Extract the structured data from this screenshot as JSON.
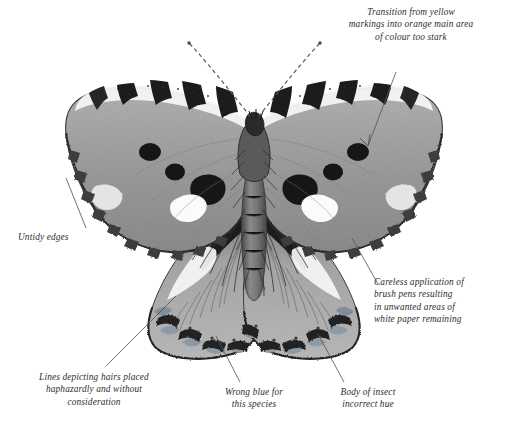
{
  "figure": {
    "species_implied": "small tortoiseshell",
    "medium": "pen and ink with grey wash",
    "palette": {
      "paper": "#ffffff",
      "ink": "#2e2c2b",
      "wing_grey": "#9a9a9a",
      "wing_light": "#c8c8c8",
      "wing_dark": "#3a3a3a",
      "black": "#1a1a1a",
      "leader_line": "#55585c"
    }
  },
  "annotations": [
    {
      "id": "transition",
      "text": "Transition from yellow\nmarkings into orange main area\nof colour too stark",
      "position": "top-right",
      "leader": "arrow"
    },
    {
      "id": "untidy",
      "text": "Untidy edges",
      "position": "left",
      "leader": "line"
    },
    {
      "id": "careless",
      "text": "Careless application of\nbrush pens resulting\nin unwanted areas of\nwhite paper remaining",
      "position": "right",
      "leader": "line"
    },
    {
      "id": "lines",
      "text": "Lines depicting hairs placed\nhaphazardly and without\nconsideration",
      "position": "bottom-left",
      "leader": "line"
    },
    {
      "id": "blue",
      "text": "Wrong blue for\nthis species",
      "position": "bottom-center",
      "leader": "line"
    },
    {
      "id": "body",
      "text": "Body of insect\nincorrect hue",
      "position": "bottom-right",
      "leader": "line"
    }
  ]
}
